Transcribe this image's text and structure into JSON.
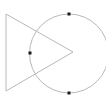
{
  "diagram": {
    "background": "#ffffff",
    "stroke_color": "#b8b8b8",
    "point_color": "#1a1a1a",
    "triangle": {
      "points": [
        [
          6,
          14
        ],
        [
          73,
          52
        ],
        [
          6,
          91
        ]
      ]
    },
    "circle": {
      "cx": 69,
      "cy": 53.5,
      "r": 39.5
    },
    "points": [
      {
        "x": 69,
        "y": 14
      },
      {
        "x": 30,
        "y": 53
      },
      {
        "x": 69,
        "y": 93
      }
    ]
  }
}
